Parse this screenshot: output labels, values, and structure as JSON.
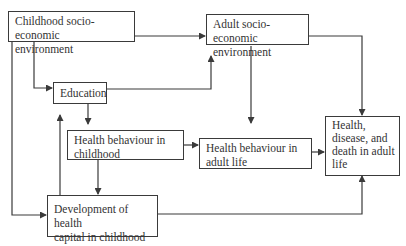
{
  "diagram": {
    "type": "flowchart",
    "nodes": {
      "childhood_ses": {
        "id": "childhood_ses",
        "lines": [
          "Childhood socio-economic",
          "environment"
        ]
      },
      "adult_ses": {
        "id": "adult_ses",
        "lines": [
          "Adult socio-economic",
          "environment"
        ]
      },
      "education": {
        "id": "education",
        "lines": [
          "Education"
        ]
      },
      "hb_childhood": {
        "id": "hb_childhood",
        "lines": [
          "Health behaviour in",
          "childhood"
        ]
      },
      "hb_adult": {
        "id": "hb_adult",
        "lines": [
          "Health behaviour in",
          "adult life"
        ]
      },
      "health_outcome": {
        "id": "health_outcome",
        "lines": [
          "Health,",
          "disease, and",
          "death in adult",
          "life"
        ]
      },
      "health_capital": {
        "id": "health_capital",
        "lines": [
          "Development of health",
          "capital in childhood"
        ]
      }
    },
    "edges": [
      {
        "from": "childhood_ses",
        "to": "adult_ses"
      },
      {
        "from": "childhood_ses",
        "to": "education"
      },
      {
        "from": "childhood_ses",
        "to": "health_capital"
      },
      {
        "from": "education",
        "to": "adult_ses"
      },
      {
        "from": "education",
        "to": "hb_childhood"
      },
      {
        "from": "health_capital",
        "to": "education"
      },
      {
        "from": "hb_childhood",
        "to": "hb_adult"
      },
      {
        "from": "hb_childhood",
        "to": "health_capital"
      },
      {
        "from": "adult_ses",
        "to": "hb_adult"
      },
      {
        "from": "adult_ses",
        "to": "health_outcome"
      },
      {
        "from": "hb_adult",
        "to": "health_outcome"
      },
      {
        "from": "health_capital",
        "to": "health_outcome"
      }
    ],
    "colors": {
      "line": "#3a3a3a",
      "text": "#333333",
      "background": "#ffffff"
    }
  }
}
